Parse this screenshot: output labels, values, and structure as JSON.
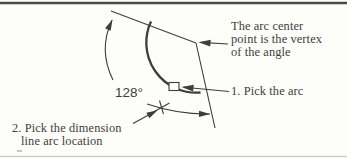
{
  "figure": {
    "angle_label": "128°",
    "annotations": {
      "vertex_note": {
        "lines": [
          "The arc center",
          "point is the vertex",
          "of the angle"
        ]
      },
      "step1_label": "1. Pick the arc",
      "step2": {
        "lines": [
          "2. Pick the dimension",
          "line arc location"
        ]
      }
    },
    "markers": {
      "pick_box": "square pick-box on the arc",
      "dimension_location": "cross marker on the dimension arc"
    },
    "colors": {
      "ink": "#3d3d3d",
      "background": "#fdfdfa",
      "top_rule": "#4b4b4b"
    }
  }
}
